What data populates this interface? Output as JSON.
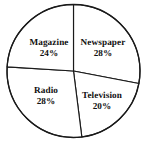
{
  "chart_data": {
    "type": "pie",
    "title": "",
    "subtitle": "",
    "xlabel": "",
    "ylabel": "",
    "legend": "none",
    "grid": false,
    "labels_inside_slices": true,
    "start_angle_deg": 0,
    "direction": "clockwise",
    "categories": [
      "Newspaper",
      "Television",
      "Radio",
      "Magazine"
    ],
    "values": [
      28,
      20,
      28,
      24
    ],
    "value_unit": "%",
    "slices": [
      {
        "name": "Newspaper",
        "value": 28,
        "percent_text": "28%",
        "start_angle_deg": 0,
        "end_angle_deg": 100.8,
        "fill": "#ffffff",
        "stroke": "#1a1a1a",
        "label_x": 103,
        "label_y": 48
      },
      {
        "name": "Television",
        "value": 20,
        "percent_text": "20%",
        "start_angle_deg": 100.8,
        "end_angle_deg": 172.8,
        "fill": "#ffffff",
        "stroke": "#1a1a1a",
        "label_x": 102,
        "label_y": 101
      },
      {
        "name": "Radio",
        "value": 28,
        "percent_text": "28%",
        "start_angle_deg": 172.8,
        "end_angle_deg": 273.6,
        "fill": "#ffffff",
        "stroke": "#1a1a1a",
        "label_x": 46,
        "label_y": 96
      },
      {
        "name": "Magazine",
        "value": 24,
        "percent_text": "24%",
        "start_angle_deg": 273.6,
        "end_angle_deg": 360,
        "fill": "#ffffff",
        "stroke": "#1a1a1a",
        "label_x": 49,
        "label_y": 48
      }
    ],
    "geometry": {
      "center_x": 73.5,
      "center_y": 71,
      "radius": 66.5
    },
    "colors": {
      "background": "#ffffff",
      "stroke": "#1a1a1a",
      "text": "#111111"
    }
  }
}
